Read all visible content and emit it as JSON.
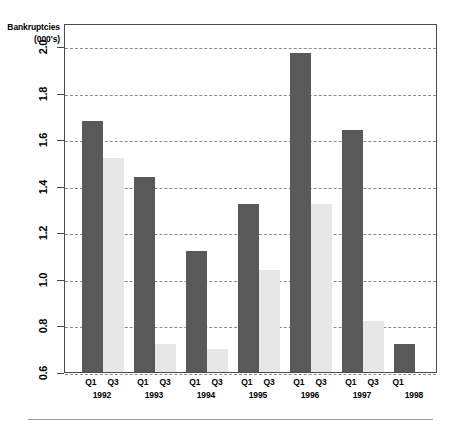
{
  "chart_data": {
    "type": "bar",
    "title": "",
    "subtitle": "",
    "xlabel": "",
    "ylabel": "Bankruptcies (000's)",
    "ylabel_lines": [
      "Bankruptcies",
      "(000's)"
    ],
    "ylim": [
      0.6,
      2.1
    ],
    "yticks": [
      "2.0",
      "1.8",
      "1.6",
      "1.4",
      "1.2",
      "1.0",
      "0.8",
      "0.6"
    ],
    "ytick_values": [
      2.0,
      1.8,
      1.6,
      1.4,
      1.2,
      1.0,
      0.8,
      0.6
    ],
    "grid": true,
    "legend": "none",
    "categories": [
      "1992",
      "1993",
      "1994",
      "1995",
      "1996",
      "1997",
      "1998"
    ],
    "quarter_labels": [
      "Q1",
      "Q3"
    ],
    "series": [
      {
        "name": "Q1",
        "values": [
          1.68,
          1.44,
          1.12,
          1.32,
          1.97,
          1.64,
          0.72
        ]
      },
      {
        "name": "Q3",
        "values": [
          1.52,
          0.72,
          0.7,
          1.04,
          1.32,
          0.82,
          null
        ]
      }
    ],
    "groups": [
      {
        "year": "1992",
        "q1": 1.68,
        "q3": 1.52
      },
      {
        "year": "1993",
        "q1": 1.44,
        "q3": 0.72
      },
      {
        "year": "1994",
        "q1": 1.12,
        "q3": 0.7
      },
      {
        "year": "1995",
        "q1": 1.32,
        "q3": 1.04
      },
      {
        "year": "1996",
        "q1": 1.97,
        "q3": 1.32
      },
      {
        "year": "1997",
        "q1": 1.64,
        "q3": 0.82
      },
      {
        "year": "1998",
        "q1": 0.72,
        "q3": null
      }
    ],
    "colors": {
      "q1_bar": "#595959",
      "q3_bar": "#e7e7e7",
      "grid": "#8c8c8c",
      "axis": "#4a4a4a",
      "background": "#ffffff"
    }
  }
}
